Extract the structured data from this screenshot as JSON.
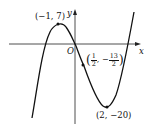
{
  "diagram": {
    "type": "function-graph",
    "axes": {
      "x_label": "x",
      "y_label": "y",
      "origin_label": "O"
    },
    "points": [
      {
        "name": "local-maximum",
        "label": "(−1, 7)",
        "x": -1,
        "y": 7
      },
      {
        "name": "inflection-point",
        "label_open": "(",
        "frac1_num": "1",
        "frac1_den": "2",
        "sep": ", −",
        "frac2_num": "13",
        "frac2_den": "2",
        "label_close": ")",
        "x": 0.5,
        "y": -6.5
      },
      {
        "name": "local-minimum",
        "label": "(2, −20)",
        "x": 2,
        "y": -20
      }
    ],
    "colors": {
      "curve": "#111111",
      "axes": "#222222",
      "background": "#ffffff"
    }
  }
}
